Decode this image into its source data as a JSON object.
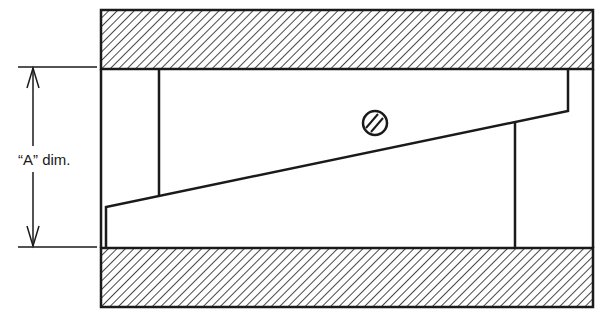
{
  "diagram": {
    "type": "mechanical-cross-section",
    "dimension_label": "“A” dim.",
    "colors": {
      "line": "#1a1a1a",
      "background": "#ffffff"
    },
    "parts": [
      {
        "name": "top-plate",
        "style": "hatched"
      },
      {
        "name": "bottom-plate",
        "style": "hatched"
      },
      {
        "name": "tapered-wedge",
        "style": "outline"
      },
      {
        "name": "slotted-screw",
        "style": "outline"
      },
      {
        "name": "dimension-arrow",
        "style": "double-arrow"
      }
    ]
  }
}
